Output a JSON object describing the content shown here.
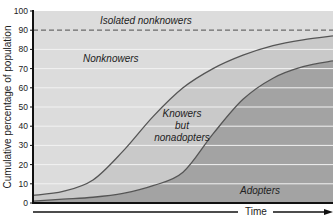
{
  "chart_data": {
    "type": "area",
    "title": "",
    "xlabel": "Time",
    "ylabel": "Cumulative percentage of population",
    "ylim": [
      0,
      100
    ],
    "yticks": [
      0,
      10,
      20,
      30,
      40,
      50,
      60,
      70,
      80,
      90,
      100
    ],
    "grid": true,
    "legend": "none (inline region labels)",
    "x": [
      0,
      10,
      20,
      30,
      40,
      50,
      60,
      70,
      80,
      90,
      100
    ],
    "series": [
      {
        "name": "Knowers (upper curve)",
        "values": [
          4,
          6,
          12,
          27,
          45,
          60,
          70,
          77,
          82,
          85,
          87
        ]
      },
      {
        "name": "Adopters (lower curve)",
        "values": [
          1,
          2,
          3,
          5,
          9,
          16,
          36,
          54,
          65,
          71,
          74
        ]
      },
      {
        "name": "Isolated nonknowers threshold (dashed)",
        "values": [
          90,
          90,
          90,
          90,
          90,
          90,
          90,
          90,
          90,
          90,
          90
        ]
      }
    ],
    "annotations": [
      {
        "text": "Isolated nonknowers",
        "region": "above 90%"
      },
      {
        "text": "Nonknowers",
        "region": "between 90% line and knowers curve"
      },
      {
        "text": "Knowers but nonadopters",
        "region": "between knowers and adopters curves"
      },
      {
        "text": "Adopters",
        "region": "below adopters curve"
      }
    ]
  },
  "labels": {
    "isolated": "Isolated nonknowers",
    "nonknowers": "Nonknowers",
    "knowers1": "Knowers",
    "knowers2": "but",
    "knowers3": "nonadopters",
    "adopters": "Adopters",
    "time": "Time",
    "ylabel": "Cumulative percentage of population"
  },
  "colors": {
    "background": "#dcdcdc",
    "knowers_fill": "#c9c9c9",
    "adopters_fill": "#a3a3a3",
    "curve": "#555555",
    "grid": "#f2f2f2",
    "axis": "#111111"
  }
}
